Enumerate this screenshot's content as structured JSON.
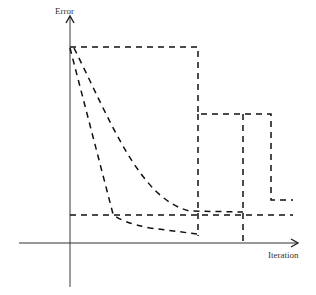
{
  "diagram": {
    "y_axis_label": "Error",
    "x_axis_label": "Iteration",
    "curves": [
      {
        "name": "step-curve",
        "description": "Piecewise constant error drops at discrete iterations"
      },
      {
        "name": "fast-decay-curve",
        "description": "Rapid near-linear decay reaching minimum early"
      },
      {
        "name": "slow-decay-curve",
        "description": "Smooth exponential-like decay"
      },
      {
        "name": "threshold-line",
        "description": "Horizontal dashed target error level"
      }
    ]
  }
}
